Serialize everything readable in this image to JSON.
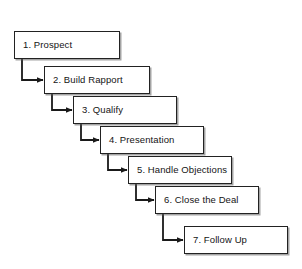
{
  "diagram": {
    "type": "flowchart",
    "orientation": "cascading-staircase",
    "background_color": "#ffffff",
    "node_border_color": "#222222",
    "node_fill_color": "#ffffff",
    "connector_color": "#1a1a1a",
    "connector_style": "elbow-with-arrowhead",
    "nodes": [
      {
        "id": "step-1",
        "label": "1. Prospect",
        "x": 14,
        "y": 31,
        "width": 106,
        "height": 28
      },
      {
        "id": "step-2",
        "label": "2. Build Rapport",
        "x": 44,
        "y": 66,
        "width": 106,
        "height": 28
      },
      {
        "id": "step-3",
        "label": "3. Qualify",
        "x": 73,
        "y": 96,
        "width": 104,
        "height": 28
      },
      {
        "id": "step-4",
        "label": "4. Presentation",
        "x": 100,
        "y": 126,
        "width": 104,
        "height": 28
      },
      {
        "id": "step-5",
        "label": "5. Handle Objections",
        "x": 128,
        "y": 156,
        "width": 104,
        "height": 28
      },
      {
        "id": "step-6",
        "label": "6. Close the Deal",
        "x": 155,
        "y": 186,
        "width": 104,
        "height": 28
      },
      {
        "id": "step-7",
        "label": "7. Follow Up",
        "x": 184,
        "y": 226,
        "width": 104,
        "height": 28
      }
    ],
    "connectors": [
      {
        "id": "conn-1-2",
        "from": "step-1",
        "to": "step-2",
        "start_x": 22,
        "start_y": 59,
        "corner_y": 80,
        "end_x": 44
      },
      {
        "id": "conn-2-3",
        "from": "step-2",
        "to": "step-3",
        "start_x": 52,
        "start_y": 94,
        "corner_y": 110,
        "end_x": 73
      },
      {
        "id": "conn-3-4",
        "from": "step-3",
        "to": "step-4",
        "start_x": 81,
        "start_y": 124,
        "corner_y": 140,
        "end_x": 100
      },
      {
        "id": "conn-4-5",
        "from": "step-4",
        "to": "step-5",
        "start_x": 108,
        "start_y": 154,
        "corner_y": 170,
        "end_x": 128
      },
      {
        "id": "conn-5-6",
        "from": "step-5",
        "to": "step-6",
        "start_x": 136,
        "start_y": 184,
        "corner_y": 200,
        "end_x": 155
      },
      {
        "id": "conn-6-7",
        "from": "step-6",
        "to": "step-7",
        "start_x": 163,
        "start_y": 214,
        "corner_y": 240,
        "end_x": 184
      }
    ]
  }
}
